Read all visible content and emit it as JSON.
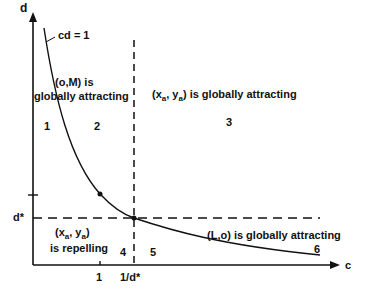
{
  "axes": {
    "y_label": "d",
    "x_label": "c",
    "y_tick_label": "d*",
    "x_tick_labels": [
      "1",
      "1/d*"
    ]
  },
  "curve_label": "cd = 1",
  "regions": [
    {
      "id": "1",
      "label": "1"
    },
    {
      "id": "2",
      "label": "2"
    },
    {
      "id": "3",
      "label": "3"
    },
    {
      "id": "4",
      "label": "4"
    },
    {
      "id": "5",
      "label": "5"
    },
    {
      "id": "6",
      "label": "6"
    }
  ],
  "annotations": {
    "om_line1": "(o,M) is",
    "om_line2": "globally attracting",
    "xa_global_pre": "(x",
    "xa_global_sub1": "a",
    "xa_global_mid": ", y",
    "xa_global_sub2": "a",
    "xa_global_post": ") is globally attracting",
    "xa_rep_pre": "(x",
    "xa_rep_sub1": "a",
    "xa_rep_mid": ", y",
    "xa_rep_sub2": "a",
    "xa_rep_post": ")",
    "xa_rep_line2": "is repelling",
    "lo_global": "(L,o) is globally attracting"
  }
}
